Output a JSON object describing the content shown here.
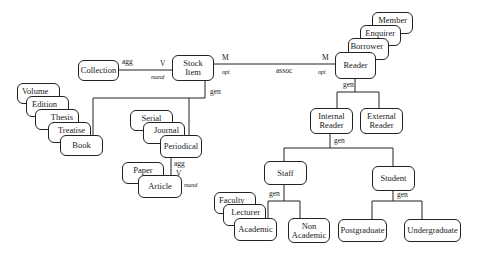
{
  "diagram": {
    "type": "entity-relationship / class hierarchy",
    "entities": {
      "collection": "Collection",
      "stock_item": "Stock\nItem",
      "member": "Member",
      "enquirer": "Enquirer",
      "borrower": "Borrower",
      "reader": "Reader",
      "internal_reader": "Internal\nReader",
      "external_reader": "External\nReader",
      "volume": "Volume",
      "edition": "Edition",
      "thesis": "Thesis",
      "treatise": "Treatise",
      "book": "Book",
      "serial": "Serial",
      "journal": "Journal",
      "periodical": "Periodical",
      "paper": "Paper",
      "article": "Article",
      "staff": "Staff",
      "student": "Student",
      "faculty": "Faculty",
      "lecturer": "Lecturer",
      "academic": "Academic",
      "non_academic": "Non\nAcademic",
      "postgraduate": "Postgraduate",
      "undergraduate": "Undergraduate"
    },
    "relationships": {
      "collection_stock": {
        "type": "agg",
        "cardinality": "V",
        "constraint": "mand"
      },
      "stock_reader": {
        "type": "assoc",
        "card_left": "M",
        "opt_left": "opt",
        "card_right": "M",
        "opt_right": "opt"
      },
      "stock_gen": "gen",
      "reader_gen": "gen",
      "internal_gen": "gen",
      "staff_gen": "gen",
      "student_gen": "gen",
      "periodical_article": {
        "type": "agg",
        "cardinality": "V",
        "constraint": "mand"
      }
    }
  }
}
